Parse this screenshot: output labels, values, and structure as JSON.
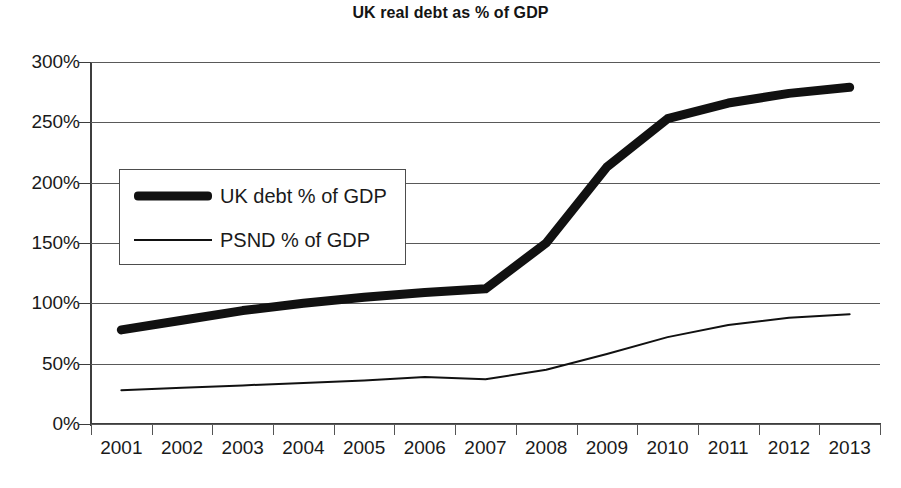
{
  "chart_data": {
    "type": "line",
    "title": "UK real debt as % of GDP",
    "xlabel": "",
    "ylabel": "",
    "x": [
      2001,
      2002,
      2003,
      2004,
      2005,
      2006,
      2007,
      2008,
      2009,
      2010,
      2011,
      2012,
      2013
    ],
    "categories": [
      "2001",
      "2002",
      "2003",
      "2004",
      "2005",
      "2006",
      "2007",
      "2008",
      "2009",
      "2010",
      "2011",
      "2012",
      "2013"
    ],
    "xlim": [
      2000.5,
      2013.5
    ],
    "ylim": [
      0,
      300
    ],
    "ytick_values": [
      0,
      50,
      100,
      150,
      200,
      250,
      300
    ],
    "ytick_labels": [
      "0%",
      "50%",
      "100%",
      "150%",
      "200%",
      "250%",
      "300%"
    ],
    "grid": true,
    "grid_axis": "y",
    "legend_position": "upper left inside",
    "series": [
      {
        "name": "UK debt % of GDP",
        "style": "thick",
        "color": "#111111",
        "line_width": 9,
        "values": [
          78,
          86,
          94,
          100,
          105,
          109,
          112,
          150,
          213,
          253,
          266,
          274,
          279
        ]
      },
      {
        "name": "PSND % of GDP",
        "style": "thin",
        "color": "#111111",
        "line_width": 2,
        "values": [
          28,
          30,
          32,
          34,
          36,
          39,
          37,
          45,
          58,
          72,
          82,
          88,
          91
        ]
      }
    ]
  }
}
